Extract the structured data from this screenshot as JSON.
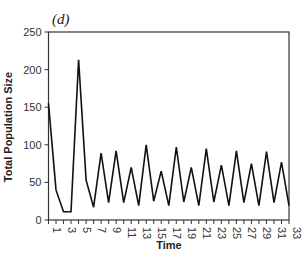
{
  "chart_data": {
    "type": "line",
    "title": "(d)",
    "xlabel": "Time",
    "ylabel": "Total Population Size",
    "ylim": [
      0,
      250
    ],
    "xlim": [
      1,
      33
    ],
    "yticks": [
      0,
      50,
      100,
      150,
      200,
      250
    ],
    "xtick_labels": [
      1,
      3,
      5,
      7,
      9,
      11,
      13,
      15,
      17,
      19,
      21,
      23,
      25,
      27,
      29,
      31,
      33
    ],
    "grid": false,
    "legend": null,
    "series": [
      {
        "name": "Total Population Size",
        "x": [
          1,
          2,
          3,
          4,
          5,
          6,
          7,
          8,
          9,
          10,
          11,
          12,
          13,
          14,
          15,
          16,
          17,
          18,
          19,
          20,
          21,
          22,
          23,
          24,
          25,
          26,
          27,
          28,
          29,
          30,
          31,
          32,
          33
        ],
        "values": [
          155,
          40,
          11,
          11,
          213,
          53,
          17,
          89,
          23,
          92,
          23,
          70,
          19,
          100,
          25,
          65,
          19,
          97,
          24,
          70,
          19,
          95,
          24,
          73,
          19,
          92,
          23,
          75,
          19,
          91,
          23,
          77,
          19
        ]
      }
    ]
  }
}
